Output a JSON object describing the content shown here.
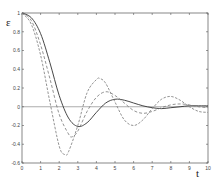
{
  "chart_data": {
    "type": "line",
    "title": "",
    "xlabel": "t",
    "ylabel": "ε",
    "xlim": [
      0,
      10
    ],
    "ylim": [
      -0.6,
      1
    ],
    "grid": false,
    "legend": null,
    "xticks": [
      "0",
      "1",
      "2",
      "3",
      "4",
      "5",
      "6",
      "7",
      "8",
      "9",
      "10"
    ],
    "yticks": [
      "1",
      "0.8",
      "0.6",
      "0.4",
      "0.2",
      "0",
      "-0.2",
      "-0.4",
      "-0.6"
    ],
    "reference_line": {
      "y": 0
    },
    "series": [
      {
        "name": "solid",
        "style": "solid",
        "x": [
          0,
          0.5,
          1,
          1.5,
          2,
          2.5,
          3,
          3.5,
          4,
          4.5,
          5,
          5.5,
          6,
          6.5,
          7,
          7.5,
          8,
          8.5,
          9,
          9.5,
          10
        ],
        "y": [
          1,
          0.95,
          0.78,
          0.47,
          0.12,
          -0.12,
          -0.21,
          -0.17,
          -0.06,
          0.04,
          0.08,
          0.07,
          0.04,
          0.01,
          -0.01,
          -0.02,
          -0.01,
          0.0,
          0.01,
          0.01,
          0.01
        ]
      },
      {
        "name": "dashed",
        "style": "dashed",
        "x": [
          0,
          0.5,
          1,
          1.5,
          2,
          2.5,
          2.7,
          3,
          3.5,
          4,
          4.5,
          5,
          5.5,
          6,
          6.5,
          7,
          7.5,
          8,
          8.5,
          9,
          9.5,
          10
        ],
        "y": [
          1,
          0.92,
          0.66,
          0.3,
          -0.08,
          -0.29,
          -0.32,
          -0.26,
          -0.05,
          0.1,
          0.16,
          0.12,
          0.04,
          -0.04,
          -0.07,
          -0.05,
          -0.01,
          0.02,
          0.03,
          0.02,
          0.0,
          -0.01
        ]
      },
      {
        "name": "dash-dot",
        "style": "dashdot",
        "x": [
          0,
          0.5,
          1,
          1.5,
          2,
          2.3,
          2.5,
          3,
          3.5,
          4,
          4.2,
          4.5,
          5,
          5.5,
          6,
          6.5,
          7,
          7.5,
          8,
          8.5,
          9,
          9.5,
          10
        ],
        "y": [
          1,
          0.88,
          0.55,
          0.05,
          -0.42,
          -0.51,
          -0.48,
          -0.2,
          0.15,
          0.29,
          0.3,
          0.25,
          0.05,
          -0.14,
          -0.2,
          -0.14,
          -0.02,
          0.08,
          0.11,
          0.07,
          0.0,
          -0.05,
          -0.06
        ]
      }
    ]
  }
}
